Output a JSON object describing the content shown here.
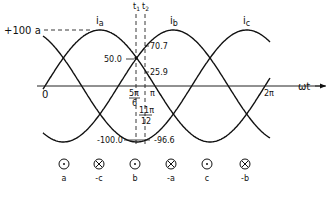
{
  "diagram": {
    "axis": {
      "x_label": "ωt",
      "origin_label": "0",
      "end_label": "2π",
      "pi_label": "π",
      "amplitude_label": "+100 a",
      "neg_amplitude_label": "-100.0"
    },
    "series_labels": {
      "ia": "ia",
      "ib": "ib",
      "ic": "ic"
    },
    "time_markers": [
      {
        "name": "t1",
        "label": "t",
        "sub": "1",
        "angle_num": "5π",
        "angle_den": "6"
      },
      {
        "name": "t2",
        "label": "t",
        "sub": "2",
        "angle_num": "11π",
        "angle_den": "12"
      }
    ],
    "values": {
      "t1_value": "50.0",
      "t2_ib": "70.7",
      "t2_ia": "25.9",
      "t2_ic": "-96.6"
    },
    "conductors": [
      {
        "symbol": "dot",
        "label": "a"
      },
      {
        "symbol": "cross",
        "label": "-c"
      },
      {
        "symbol": "dot",
        "label": "b"
      },
      {
        "symbol": "cross",
        "label": "-a"
      },
      {
        "symbol": "dot",
        "label": "c"
      },
      {
        "symbol": "cross",
        "label": "-b"
      }
    ]
  },
  "chart_data": {
    "type": "line",
    "title": "",
    "xlabel": "ωt",
    "ylabel": "",
    "xlim": [
      0,
      "2π"
    ],
    "ylim": [
      -100,
      100
    ],
    "series": [
      {
        "name": "ia",
        "function": "100 sin(ωt)"
      },
      {
        "name": "ib",
        "function": "100 sin(ωt - 2π/3)"
      },
      {
        "name": "ic",
        "function": "100 sin(ωt - 4π/3)"
      }
    ],
    "annotations": [
      {
        "at": "5π/6 (t1)",
        "ia": 50.0,
        "ib": 50.0,
        "ic": -100.0
      },
      {
        "at": "11π/12 (t2)",
        "ia": 25.9,
        "ib": 70.7,
        "ic": -96.6
      }
    ]
  }
}
